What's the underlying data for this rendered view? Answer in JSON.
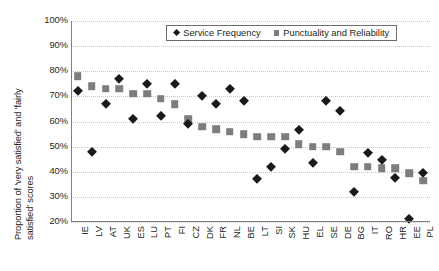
{
  "chart_data": {
    "type": "scatter",
    "title": "",
    "xlabel": "",
    "ylabel": "Proportion of 'very satisfied' and 'fairly satisfied' scores",
    "ylabel_lines": [
      "Proportion of 'very satisfied' and 'fairly",
      "satisfied' scores"
    ],
    "ylim": [
      20,
      100
    ],
    "ytick_labels": [
      "100%",
      "90%",
      "80%",
      "70%",
      "60%",
      "50%",
      "40%",
      "30%",
      "20%"
    ],
    "ytick_values": [
      100,
      90,
      80,
      70,
      60,
      50,
      40,
      30,
      20
    ],
    "grid": true,
    "legend_position": "top-center-inside",
    "categories": [
      "IE",
      "LV",
      "AT",
      "UK",
      "ES",
      "LU",
      "PT",
      "FI",
      "CZ",
      "DK",
      "FR",
      "NL",
      "BE",
      "LT",
      "SI",
      "SK",
      "HU",
      "EL",
      "SE",
      "DE",
      "BG",
      "IT",
      "RO",
      "HR",
      "EE",
      "PL"
    ],
    "series": [
      {
        "name": "Service Frequency",
        "marker": "diamond",
        "color": "#1a1a1a",
        "values": [
          72,
          48,
          67,
          77,
          61,
          75,
          62,
          75,
          59,
          70,
          67,
          73,
          68,
          37,
          42,
          49,
          56.5,
          43.5,
          68,
          64,
          32,
          47.5,
          44.5,
          37.5,
          21,
          39.5
        ]
      },
      {
        "name": "Punctuality and Reliability",
        "marker": "square",
        "color": "#7d7d7d",
        "values": [
          78,
          74,
          73,
          73,
          71,
          71,
          69,
          67,
          61,
          58,
          57,
          56,
          55,
          54,
          54,
          54,
          51,
          50,
          50,
          48,
          42,
          42,
          41.5,
          41.5,
          39.5,
          36.5
        ]
      }
    ]
  },
  "legend": {
    "entries": [
      {
        "label": "Service Frequency",
        "marker": "diamond"
      },
      {
        "label": "Punctuality and Reliability",
        "marker": "square"
      }
    ]
  },
  "colors": {
    "series_1": "#1a1a1a",
    "series_2": "#7d7d7d",
    "gridline": "#c8c8c8",
    "axis": "#808080",
    "text": "#231f20",
    "background": "#ffffff"
  }
}
